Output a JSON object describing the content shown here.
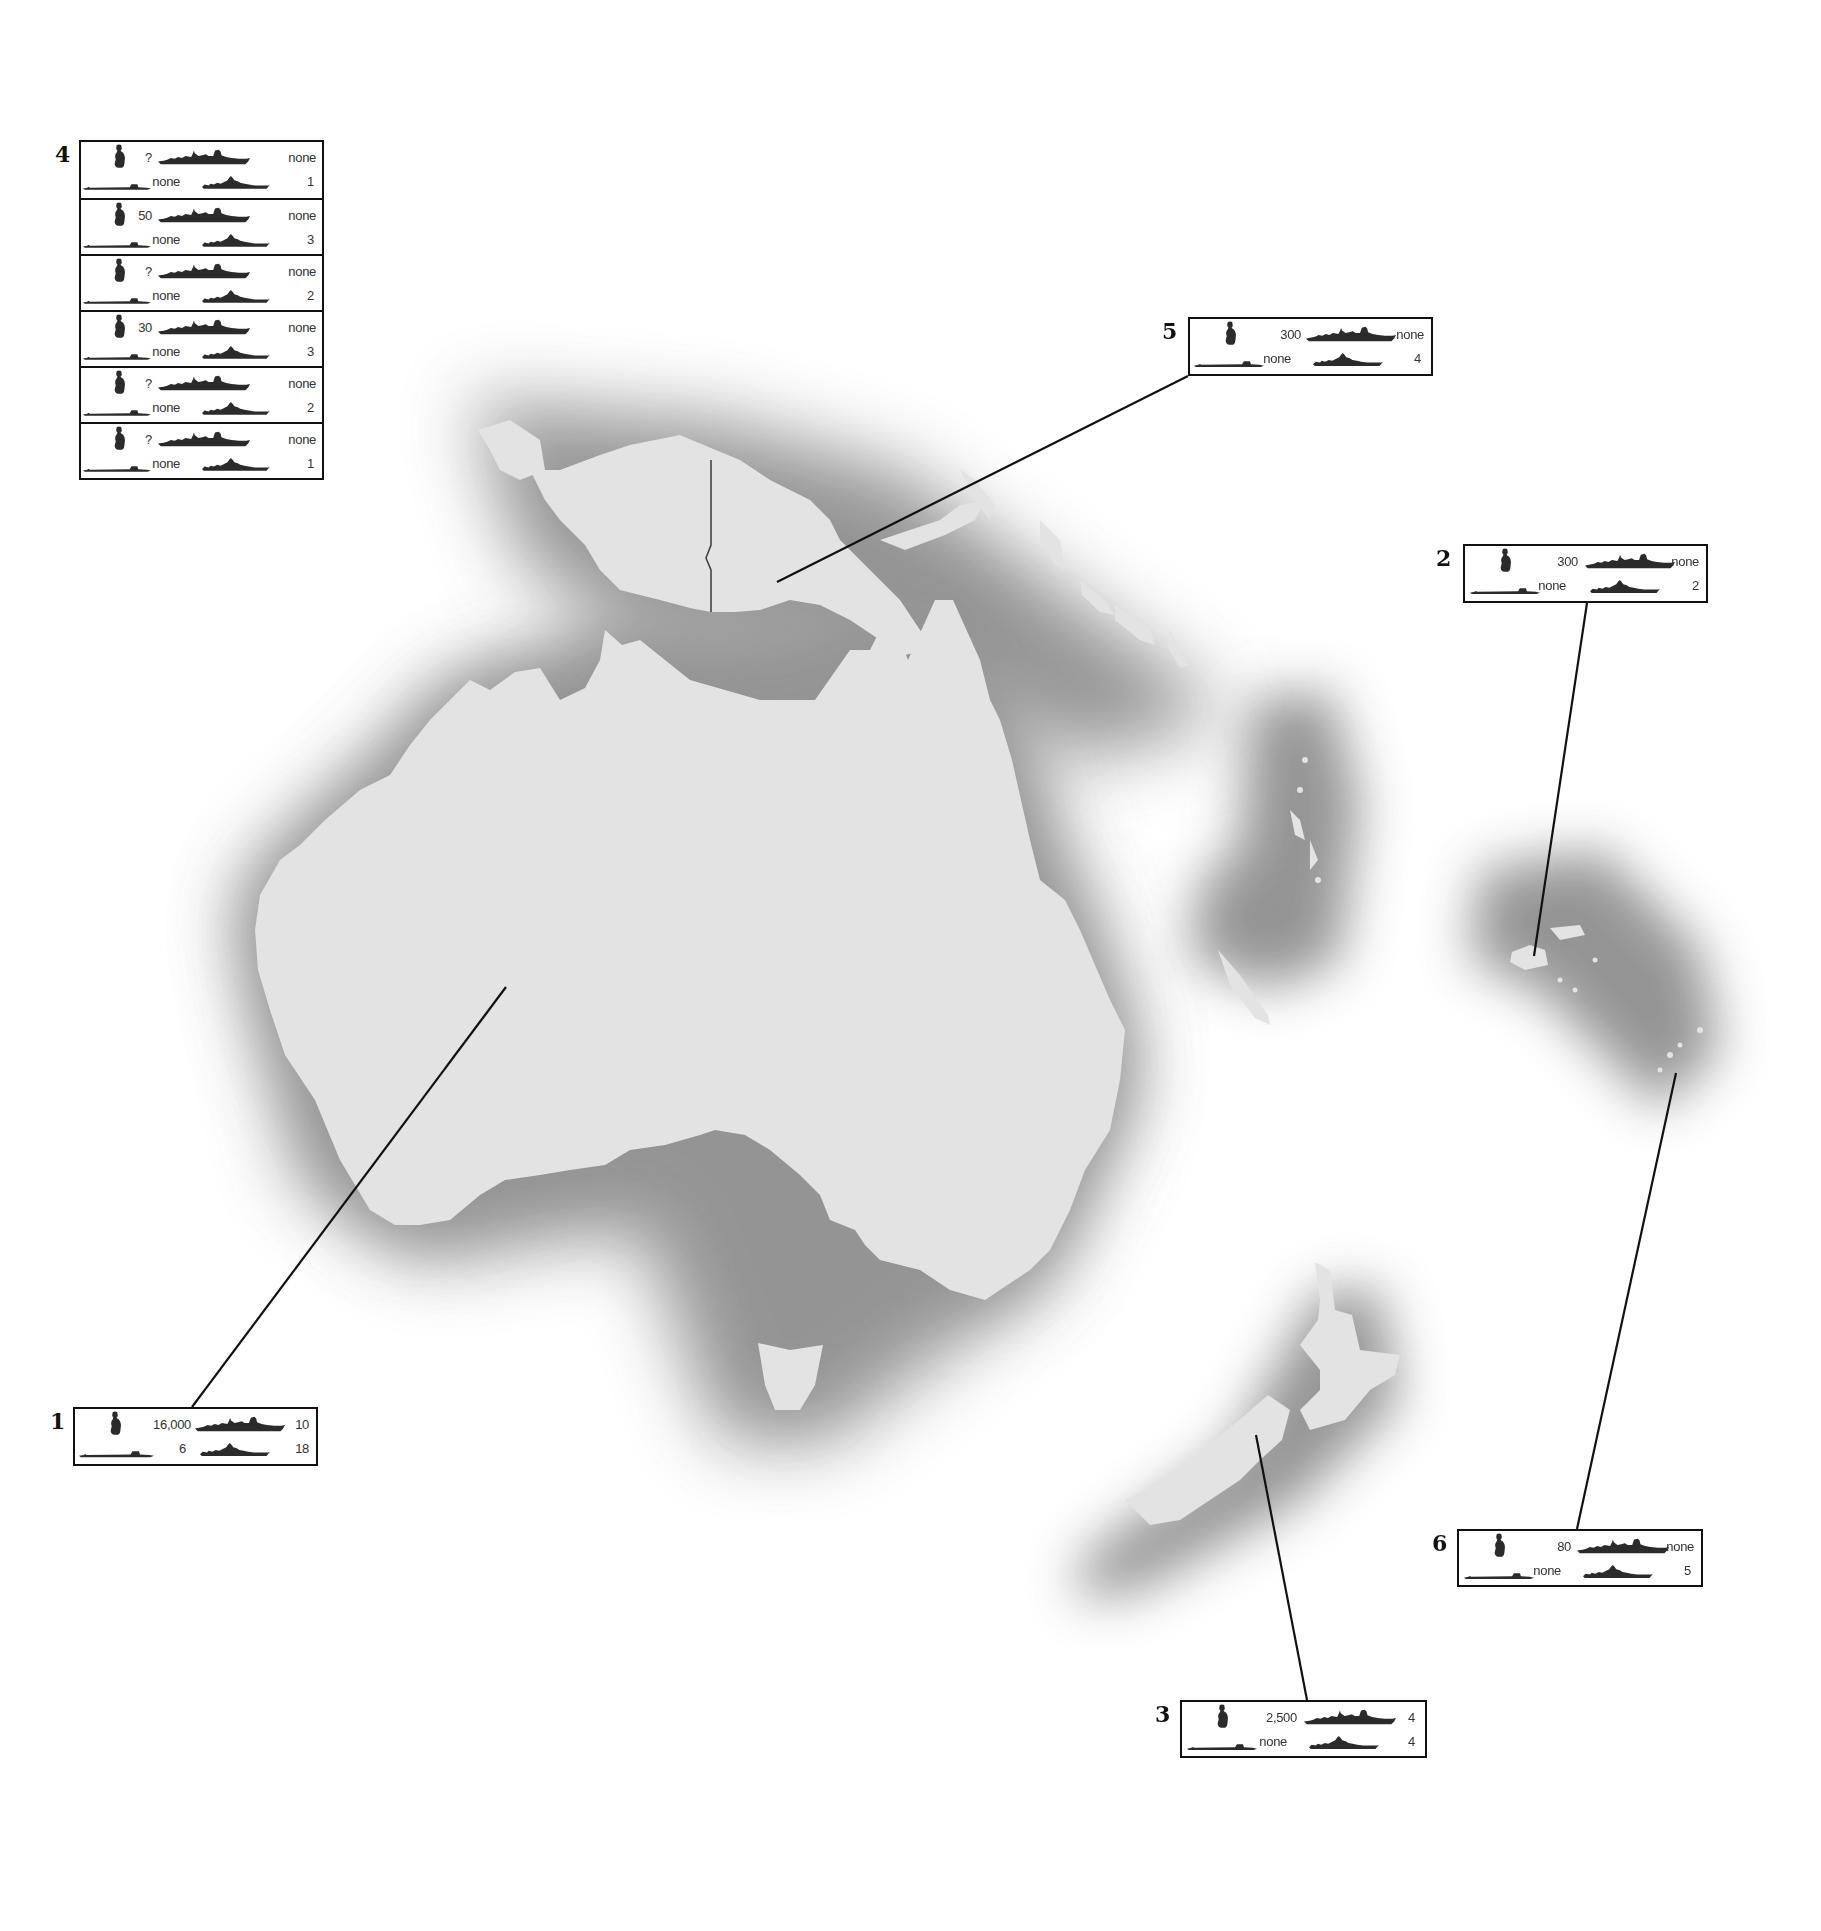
{
  "map": {
    "region": "Australia and South-West Pacific",
    "colors": {
      "land": "#e3e3e3",
      "halo": "#8f8f8f",
      "sea": "#ffffff",
      "line": "#111111",
      "icon": "#2b2b2b"
    },
    "legend_icons": [
      "soldier-icon",
      "warship-icon",
      "submarine-icon",
      "frigate-icon"
    ]
  },
  "callouts": [
    {
      "id": "1",
      "label": "1",
      "place": "Australia",
      "personnel": "16,000",
      "major_warships": "10",
      "submarines": "6",
      "frigates": "18"
    },
    {
      "id": "2",
      "label": "2",
      "place": "Fiji",
      "personnel": "300",
      "major_warships": "none",
      "submarines": "none",
      "frigates": "2"
    },
    {
      "id": "3",
      "label": "3",
      "place": "New Zealand",
      "personnel": "2,500",
      "major_warships": "4",
      "submarines": "none",
      "frigates": "4"
    },
    {
      "id": "5",
      "label": "5",
      "place": "Papua New Guinea",
      "personnel": "300",
      "major_warships": "none",
      "submarines": "none",
      "frigates": "4"
    },
    {
      "id": "6",
      "label": "6",
      "place": "Tonga",
      "personnel": "80",
      "major_warships": "none",
      "submarines": "none",
      "frigates": "5"
    }
  ],
  "group4": {
    "label": "4",
    "entries": [
      {
        "personnel": "?",
        "major_warships": "none",
        "submarines": "none",
        "frigates": "1"
      },
      {
        "personnel": "50",
        "major_warships": "none",
        "submarines": "none",
        "frigates": "3"
      },
      {
        "personnel": "?",
        "major_warships": "none",
        "submarines": "none",
        "frigates": "2"
      },
      {
        "personnel": "30",
        "major_warships": "none",
        "submarines": "none",
        "frigates": "3"
      },
      {
        "personnel": "?",
        "major_warships": "none",
        "submarines": "none",
        "frigates": "2"
      },
      {
        "personnel": "?",
        "major_warships": "none",
        "submarines": "none",
        "frigates": "1"
      }
    ]
  }
}
